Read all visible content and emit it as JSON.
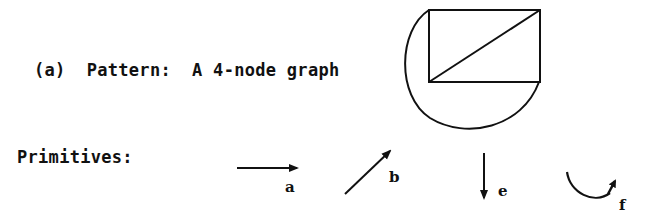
{
  "figure": {
    "caption": "(a)  Pattern:  A 4-node graph",
    "primitives_heading": "Primitives:",
    "graph": {
      "nodes": 4,
      "edges": [
        "top",
        "right",
        "bottom",
        "left",
        "diagonal",
        "arc"
      ]
    },
    "primitives": [
      {
        "label": "a",
        "shape": "horizontal arrow right"
      },
      {
        "label": "b",
        "shape": "diagonal arrow up-right"
      },
      {
        "label": "e",
        "shape": "vertical arrow down"
      },
      {
        "label": "f",
        "shape": "curved arc arrow"
      }
    ],
    "colors": {
      "ink": "#111111",
      "background": "#ffffff"
    }
  }
}
